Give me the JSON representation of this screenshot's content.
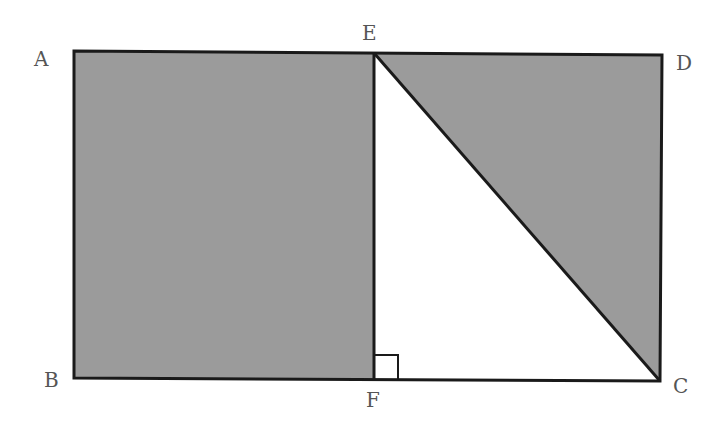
{
  "diagram": {
    "type": "geometry",
    "fill_color": "#9b9b9b",
    "stroke_color": "#1a1a1a",
    "points": {
      "A": {
        "label": "A",
        "x": 74,
        "y": 51
      },
      "E": {
        "label": "E",
        "x": 374,
        "y": 53
      },
      "D": {
        "label": "D",
        "x": 662,
        "y": 55
      },
      "B": {
        "label": "B",
        "x": 74,
        "y": 378
      },
      "F": {
        "label": "F",
        "x": 374,
        "y": 379
      },
      "C": {
        "label": "C",
        "x": 660,
        "y": 381
      }
    },
    "shaded_regions": [
      "ABFE",
      "ECD"
    ],
    "unshaded_regions": [
      "EFC"
    ],
    "right_angle_at": "F"
  }
}
